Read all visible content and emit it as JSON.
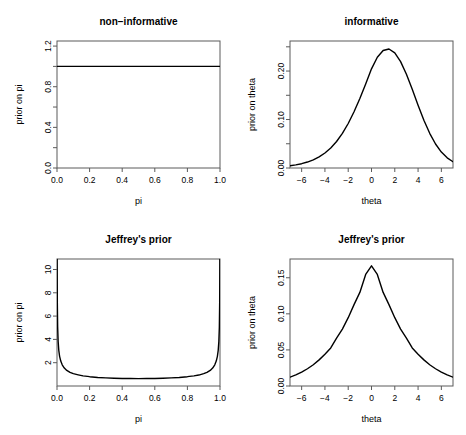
{
  "figure": {
    "background": "#ffffff",
    "line_color": "#000000",
    "axis_color": "#5a5a5a",
    "layout": "2x2"
  },
  "chart_data": [
    {
      "type": "line",
      "panel": "top-left",
      "title": "non−informative",
      "xlabel": "pi",
      "ylabel": "prior on pi",
      "xlim": [
        0.0,
        1.0
      ],
      "ylim": [
        0.0,
        1.25
      ],
      "xticks": [
        0.0,
        0.2,
        0.4,
        0.6,
        0.8,
        1.0
      ],
      "xticklabels": [
        "0.0",
        "0.2",
        "0.4",
        "0.6",
        "0.8",
        "1.0"
      ],
      "yticks": [
        0.0,
        0.4,
        0.8,
        1.2
      ],
      "yticklabels": [
        "0.0",
        "0.4",
        "0.8",
        "1.2"
      ],
      "yminorticks": [
        0.2,
        0.6,
        1.0
      ],
      "grid": false,
      "legend": null,
      "x": [
        0.0,
        0.05,
        0.1,
        0.15,
        0.2,
        0.25,
        0.3,
        0.35,
        0.4,
        0.45,
        0.5,
        0.55,
        0.6,
        0.65,
        0.7,
        0.75,
        0.8,
        0.85,
        0.9,
        0.95,
        1.0
      ],
      "y": [
        1.0,
        1.0,
        1.0,
        1.0,
        1.0,
        1.0,
        1.0,
        1.0,
        1.0,
        1.0,
        1.0,
        1.0,
        1.0,
        1.0,
        1.0,
        1.0,
        1.0,
        1.0,
        1.0,
        1.0,
        1.0
      ]
    },
    {
      "type": "line",
      "panel": "top-right",
      "title": "informative",
      "xlabel": "theta",
      "ylabel": "prior on theta",
      "xlim": [
        -7.0,
        7.0
      ],
      "ylim": [
        0.0,
        0.262
      ],
      "xticks": [
        -6,
        -4,
        -2,
        0,
        2,
        4,
        6
      ],
      "xticklabels": [
        "−6",
        "−4",
        "−2",
        "0",
        "2",
        "4",
        "6"
      ],
      "yticks": [
        0.0,
        0.1,
        0.2
      ],
      "yticklabels": [
        "0.00",
        "0.10",
        "0.20"
      ],
      "yminorticks": [
        0.05,
        0.15,
        0.25
      ],
      "grid": false,
      "legend": null,
      "x": [
        -7.0,
        -6.5,
        -6.0,
        -5.5,
        -5.0,
        -4.5,
        -4.0,
        -3.5,
        -3.0,
        -2.5,
        -2.0,
        -1.5,
        -1.0,
        -0.5,
        0.0,
        0.5,
        1.0,
        1.5,
        2.0,
        2.5,
        3.0,
        3.5,
        4.0,
        4.5,
        5.0,
        5.5,
        6.0,
        6.5,
        7.0
      ],
      "y": [
        0.0045,
        0.0064,
        0.0089,
        0.0123,
        0.0169,
        0.023,
        0.031,
        0.0414,
        0.0547,
        0.0714,
        0.0918,
        0.116,
        0.1435,
        0.1733,
        0.2045,
        0.2285,
        0.2425,
        0.2455,
        0.2375,
        0.2195,
        0.1935,
        0.1625,
        0.1295,
        0.0985,
        0.0715,
        0.0495,
        0.0329,
        0.021,
        0.0129
      ]
    },
    {
      "type": "line",
      "panel": "bottom-left",
      "title": "Jeffrey's prior",
      "xlabel": "pi",
      "ylabel": "prior on pi",
      "xlim": [
        0.0,
        1.0
      ],
      "ylim": [
        0.0,
        10.9
      ],
      "xticks": [
        0.0,
        0.2,
        0.4,
        0.6,
        0.8,
        1.0
      ],
      "xticklabels": [
        "0.0",
        "0.2",
        "0.4",
        "0.6",
        "0.8",
        "1.0"
      ],
      "yticks": [
        2,
        4,
        6,
        8,
        10
      ],
      "yticklabels": [
        "2",
        "4",
        "6",
        "8",
        "10"
      ],
      "yminorticks": [],
      "grid": false,
      "legend": null,
      "note": "Beta(0.5,0.5) density, U-shaped with asymptotes at 0 and 1",
      "x": [
        0.00086,
        0.002,
        0.004,
        0.007,
        0.011,
        0.016,
        0.023,
        0.032,
        0.045,
        0.06,
        0.08,
        0.1,
        0.13,
        0.16,
        0.2,
        0.25,
        0.3,
        0.35,
        0.4,
        0.45,
        0.5,
        0.55,
        0.6,
        0.65,
        0.7,
        0.75,
        0.8,
        0.84,
        0.87,
        0.9,
        0.92,
        0.94,
        0.955,
        0.968,
        0.977,
        0.984,
        0.989,
        0.993,
        0.996,
        0.998,
        0.99914
      ],
      "y": [
        10.87,
        7.14,
        5.06,
        3.83,
        3.06,
        2.55,
        2.14,
        1.82,
        1.54,
        1.34,
        1.17,
        1.06,
        0.96,
        0.87,
        0.8,
        0.735,
        0.695,
        0.668,
        0.65,
        0.64,
        0.637,
        0.64,
        0.65,
        0.668,
        0.695,
        0.735,
        0.8,
        0.87,
        0.94,
        1.06,
        1.17,
        1.34,
        1.54,
        1.82,
        2.14,
        2.55,
        3.06,
        3.83,
        5.06,
        7.14,
        10.87
      ]
    },
    {
      "type": "line",
      "panel": "bottom-right",
      "title": "Jeffrey's prior",
      "xlabel": "theta",
      "ylabel": "prior on theta",
      "xlim": [
        -7.0,
        7.0
      ],
      "ylim": [
        0.0,
        0.176
      ],
      "xticks": [
        -6,
        -4,
        -2,
        0,
        2,
        4,
        6
      ],
      "xticklabels": [
        "−6",
        "−4",
        "−2",
        "0",
        "2",
        "4",
        "6"
      ],
      "yticks": [
        0.0,
        0.05,
        0.1,
        0.15
      ],
      "yticklabels": [
        "0.00",
        "0.05",
        "0.10",
        "0.15"
      ],
      "yminorticks": [],
      "grid": false,
      "legend": null,
      "note": "logistic-type density, peak 0.167 at theta=0",
      "x": [
        -7.0,
        -6.5,
        -6.0,
        -5.5,
        -5.0,
        -4.5,
        -4.0,
        -3.5,
        -3.0,
        -2.5,
        -2.0,
        -1.5,
        -1.0,
        -0.5,
        0.0,
        0.5,
        1.0,
        1.5,
        2.0,
        2.5,
        3.0,
        3.5,
        4.0,
        4.5,
        5.0,
        5.5,
        6.0,
        6.5,
        7.0
      ],
      "y": [
        0.0122,
        0.0153,
        0.0192,
        0.0239,
        0.0295,
        0.0362,
        0.0439,
        0.0527,
        0.0663,
        0.0789,
        0.0947,
        0.1128,
        0.1297,
        0.1546,
        0.1665,
        0.1546,
        0.1297,
        0.1128,
        0.0947,
        0.0789,
        0.0663,
        0.0527,
        0.0439,
        0.0362,
        0.0295,
        0.0239,
        0.0192,
        0.0153,
        0.0122
      ]
    }
  ]
}
